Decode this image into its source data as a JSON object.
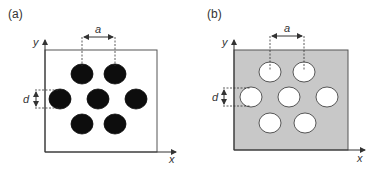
{
  "panels": [
    {
      "label": "(a)",
      "description": "Dark circular inclusions in a light matrix",
      "matrix_color": "#ffffff",
      "inclusion_color": "#0d0d0d",
      "inclusion_stroke": "#0d0d0d",
      "axis_x": "x",
      "axis_y": "y",
      "dim_spacing": "a",
      "dim_diameter": "d"
    },
    {
      "label": "(b)",
      "description": "Circular holes in a gray matrix",
      "matrix_color": "#c8c8c8",
      "inclusion_color": "#ffffff",
      "inclusion_stroke": "#333333",
      "axis_x": "x",
      "axis_y": "y",
      "dim_spacing": "a",
      "dim_diameter": "d"
    }
  ],
  "lattice": {
    "rows": [
      2,
      3,
      2
    ],
    "arrangement": "hexagonal"
  }
}
